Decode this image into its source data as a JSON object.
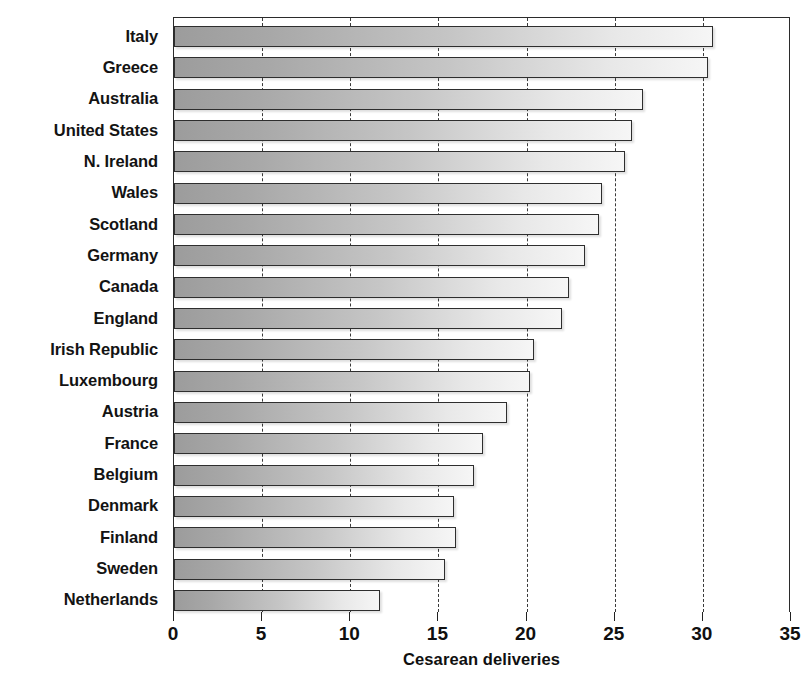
{
  "chart_data": {
    "type": "bar",
    "orientation": "horizontal",
    "title": "",
    "xlabel": "Cesarean deliveries",
    "ylabel": "",
    "xlim": [
      0,
      35
    ],
    "xticks": [
      0,
      5,
      10,
      15,
      20,
      25,
      30,
      35
    ],
    "xticklabels": [
      "0",
      "5",
      "10",
      "15",
      "20",
      "25",
      "30",
      "35"
    ],
    "grid": "vertical-dashed",
    "legend": "none",
    "categories": [
      "Italy",
      "Greece",
      "Australia",
      "United States",
      "N. Ireland",
      "Wales",
      "Scotland",
      "Germany",
      "Canada",
      "England",
      "Irish Republic",
      "Luxembourg",
      "Austria",
      "France",
      "Belgium",
      "Denmark",
      "Finland",
      "Sweden",
      "Netherlands"
    ],
    "values": [
      30.6,
      30.3,
      26.6,
      26.0,
      25.6,
      24.3,
      24.1,
      23.3,
      22.4,
      22.0,
      20.4,
      20.2,
      18.9,
      17.5,
      17.0,
      15.9,
      16.0,
      15.4,
      11.7
    ],
    "bar_style": {
      "fill": "horizontal-gradient",
      "gradient_from": "#9c9c9c",
      "gradient_to": "#f6f6f6",
      "edge_color": "#2e2e2e",
      "shadow": true
    }
  }
}
